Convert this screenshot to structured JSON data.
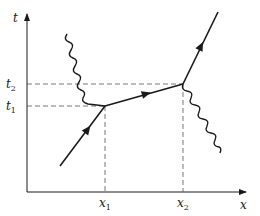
{
  "diagram": {
    "type": "spacetime-diagram",
    "axes": {
      "vertical": {
        "label": "t"
      },
      "horizontal": {
        "label": "x"
      }
    },
    "ticks": {
      "t": [
        {
          "symbol": "t",
          "subscript": "1"
        },
        {
          "symbol": "t",
          "subscript": "2"
        }
      ],
      "x": [
        {
          "symbol": "x",
          "subscript": "1"
        },
        {
          "symbol": "x",
          "subscript": "2"
        }
      ]
    },
    "colors": {
      "line": "#1a1a1a",
      "dashed": "#555555"
    },
    "elements": [
      {
        "kind": "particle-worldline",
        "from": "start",
        "to": "event-1",
        "arrow": true
      },
      {
        "kind": "particle-worldline",
        "from": "event-1",
        "to": "event-2",
        "arrow": true
      },
      {
        "kind": "particle-worldline",
        "from": "event-2",
        "to": "end",
        "arrow": true
      },
      {
        "kind": "photon-wavy-incoming",
        "to": "event-1"
      },
      {
        "kind": "photon-wavy-outgoing",
        "from": "event-2"
      }
    ]
  }
}
